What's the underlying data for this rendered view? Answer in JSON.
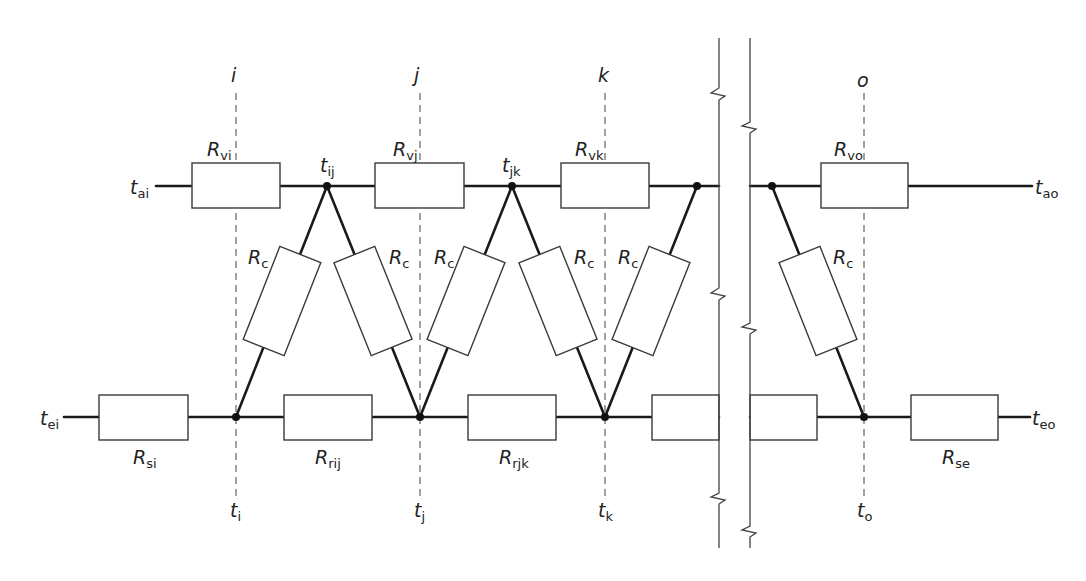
{
  "diagram": {
    "type": "thermal resistance network",
    "sections": {
      "i": "i",
      "j": "j",
      "k": "k",
      "o": "o"
    },
    "air_nodes": {
      "t_ai": {
        "main": "t",
        "sub": "ai"
      },
      "t_ij": {
        "main": "t",
        "sub": "ij"
      },
      "t_jk": {
        "main": "t",
        "sub": "jk"
      },
      "t_ao": {
        "main": "t",
        "sub": "ao"
      }
    },
    "surface_nodes": {
      "t_ei": {
        "main": "t",
        "sub": "ei"
      },
      "t_i": {
        "main": "t",
        "sub": "i"
      },
      "t_j": {
        "main": "t",
        "sub": "j"
      },
      "t_k": {
        "main": "t",
        "sub": "k"
      },
      "t_o": {
        "main": "t",
        "sub": "o"
      },
      "t_eo": {
        "main": "t",
        "sub": "eo"
      }
    },
    "air_resistors": {
      "R_vi": {
        "main": "R",
        "sub": "vi"
      },
      "R_vj": {
        "main": "R",
        "sub": "vj"
      },
      "R_vk": {
        "main": "R",
        "sub": "vk"
      },
      "R_vo": {
        "main": "R",
        "sub": "vo"
      }
    },
    "surface_resistors": {
      "R_si": {
        "main": "R",
        "sub": "si"
      },
      "R_rij": {
        "main": "R",
        "sub": "rij"
      },
      "R_rjk": {
        "main": "R",
        "sub": "rjk"
      },
      "R_se": {
        "main": "R",
        "sub": "se"
      }
    },
    "convective_resistor": {
      "main": "R",
      "sub": "c"
    }
  }
}
